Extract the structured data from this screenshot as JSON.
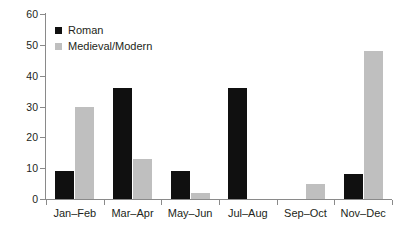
{
  "chart_data": {
    "type": "bar",
    "title": "",
    "subtitle": "",
    "xlabel": "",
    "ylabel": "",
    "ylim": [
      0,
      60
    ],
    "yticks": [
      0,
      10,
      20,
      30,
      40,
      50,
      60
    ],
    "grid": false,
    "legend_position": "top-left",
    "categories": [
      "Jan–Feb",
      "Mar–Apr",
      "May–Jun",
      "Jul–Aug",
      "Sep–Oct",
      "Nov–Dec"
    ],
    "series": [
      {
        "name": "Roman",
        "color": "#101010",
        "values": [
          9,
          36,
          9,
          36,
          0,
          8
        ]
      },
      {
        "name": "Medieval/Modern",
        "color": "#bfbfbf",
        "values": [
          30,
          13,
          2,
          0,
          5,
          48
        ]
      }
    ]
  },
  "legend": {
    "items": [
      {
        "label": "Roman",
        "swatch": "roman"
      },
      {
        "label": "Medieval/Modern",
        "swatch": "medieval"
      }
    ]
  },
  "axis": {
    "y_tick_labels": [
      "0",
      "10",
      "20",
      "30",
      "40",
      "50",
      "60"
    ],
    "x_tick_labels": [
      "Jan–Feb",
      "Mar–Apr",
      "May–Jun",
      "Jul–Aug",
      "Sep–Oct",
      "Nov–Dec"
    ]
  },
  "colors": {
    "roman": "#101010",
    "medieval": "#bfbfbf",
    "axis": "#8a8a8a",
    "text": "#231f20",
    "background": "#ffffff"
  }
}
